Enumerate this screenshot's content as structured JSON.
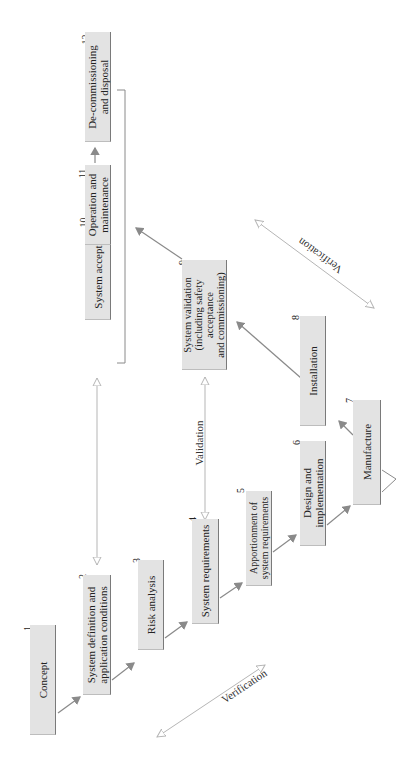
{
  "diagram": {
    "type": "V-model lifecycle (rotated 90 degrees)",
    "colors": {
      "box_fill": "#e3e3e3",
      "line": "#8a8a8a",
      "text": "#222222"
    },
    "phases": [
      {
        "num": "1",
        "label": "Concept"
      },
      {
        "num": "2",
        "label": "System definition and application conditions"
      },
      {
        "num": "3",
        "label": "Risk analysis"
      },
      {
        "num": "4",
        "label": "System requirements"
      },
      {
        "num": "5",
        "label": "Apportionment of system requirements"
      },
      {
        "num": "6",
        "label": "Design and implementation"
      },
      {
        "num": "7",
        "label": "Manufacture"
      },
      {
        "num": "8",
        "label": "Installation"
      },
      {
        "num": "9",
        "label": "System validation (including safety acceptance and commissioning)"
      },
      {
        "num": "10",
        "label": "System acceptance"
      },
      {
        "num": "11",
        "label": "Operation and maintenance"
      },
      {
        "num": "12",
        "label": "De-commissioning and disposal"
      }
    ],
    "phase_lines": {
      "p2": [
        "System definition and",
        "application conditions"
      ],
      "p5": [
        "Apportionment of",
        "system requirements"
      ],
      "p6": [
        "Design and",
        "implementation"
      ],
      "p9": [
        "System validation",
        "(including safety",
        "acceptance",
        "and commissioning)"
      ],
      "p11": [
        "Operation and",
        "maintenance"
      ],
      "p12": [
        "De-commissioning",
        "and disposal"
      ]
    },
    "relations": [
      {
        "label": "Verification",
        "from": "1",
        "to": "7",
        "side": "left"
      },
      {
        "label": "Validation",
        "from": "4",
        "to": "9"
      },
      {
        "label": "Verification",
        "from": "7",
        "to": "11",
        "side": "right"
      }
    ]
  }
}
